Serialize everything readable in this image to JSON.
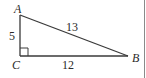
{
  "diagram": {
    "type": "right-triangle",
    "vertices": {
      "A": {
        "label": "A",
        "x": 20,
        "y": 15
      },
      "B": {
        "label": "B",
        "x": 128,
        "y": 56
      },
      "C": {
        "label": "C",
        "x": 20,
        "y": 56
      }
    },
    "sides": {
      "AC": {
        "label": "5"
      },
      "CB": {
        "label": "12"
      },
      "AB": {
        "label": "13"
      }
    },
    "right_angle_at": "C",
    "colors": {
      "stroke": "#3a3a3a",
      "text": "#2a2a2a",
      "border": "#8a8a8a"
    }
  }
}
